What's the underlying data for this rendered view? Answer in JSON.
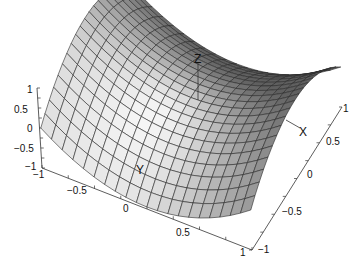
{
  "chart_data": {
    "type": "surface",
    "title": "",
    "function": "z = y^2 - x^2 (saddle / hyperbolic paraboloid)",
    "x": {
      "label": "X",
      "range": [
        -1,
        1
      ],
      "ticks": [
        -1,
        -0.5,
        0,
        0.5,
        1
      ],
      "tick_labels": [
        "-1",
        "−0.5",
        "0",
        "0.5",
        "1"
      ]
    },
    "y": {
      "label": "Y",
      "range": [
        -1,
        1
      ],
      "ticks": [
        -1,
        -0.5,
        0,
        0.5,
        1
      ],
      "tick_labels": [
        "−1",
        "−0.5",
        "0",
        "0.5",
        "1"
      ]
    },
    "z": {
      "label": "Z",
      "range": [
        -1,
        1
      ],
      "ticks": [
        -1,
        -0.5,
        0,
        0.5,
        1
      ],
      "tick_labels": [
        "−1",
        "−0.5",
        "0",
        "0.5",
        "1"
      ]
    },
    "grid_resolution": 20,
    "grid": false,
    "legend": null,
    "colormap": "gray shading",
    "axis_labels_on_plot": {
      "x": "X",
      "y": "Y",
      "z": "Z"
    }
  },
  "labels": {
    "z_axis_ticks": [
      "1",
      "0.5",
      "0",
      "−0.5",
      "−1"
    ],
    "front_axis_ticks": [
      "−1",
      "−0.5",
      "0",
      "0.5",
      "1"
    ],
    "right_axis_ticks": [
      "−1",
      "−0.5",
      "0",
      "0.5",
      "1"
    ],
    "x_name": "X",
    "y_name": "Y",
    "z_name": "Z"
  }
}
